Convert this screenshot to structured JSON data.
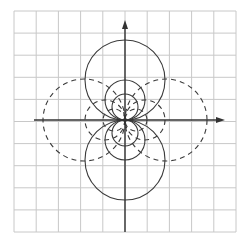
{
  "diagram": {
    "type": "dipole-field-lines",
    "grid": {
      "x0": 14,
      "y0": 11,
      "cols": 10,
      "rows": 10,
      "cell_w": 22.2,
      "cell_h": 22.1,
      "color": "#c8c8c8"
    },
    "origin": {
      "x": 125,
      "y": 120
    },
    "axes": {
      "color": "#333333",
      "x_axis": {
        "from": 34,
        "to": 225
      },
      "y_axis": {
        "from": 232,
        "to": 20
      }
    },
    "solid_circles": [
      {
        "cx": 125,
        "cy": 80,
        "r": 40
      },
      {
        "cx": 125,
        "cy": 160,
        "r": 40
      },
      {
        "cx": 125,
        "cy": 100,
        "r": 20
      },
      {
        "cx": 125,
        "cy": 140,
        "r": 20
      },
      {
        "cx": 125,
        "cy": 107,
        "r": 13
      },
      {
        "cx": 125,
        "cy": 133,
        "r": 13
      }
    ],
    "dashed_circles": [
      {
        "cx": 84,
        "cy": 120,
        "r": 41
      },
      {
        "cx": 166,
        "cy": 120,
        "r": 41
      },
      {
        "cx": 105,
        "cy": 120,
        "r": 20
      },
      {
        "cx": 145,
        "cy": 120,
        "r": 20
      },
      {
        "cx": 114,
        "cy": 120,
        "r": 11
      },
      {
        "cx": 136,
        "cy": 120,
        "r": 11
      }
    ],
    "line_color": "#3a3a3a"
  }
}
